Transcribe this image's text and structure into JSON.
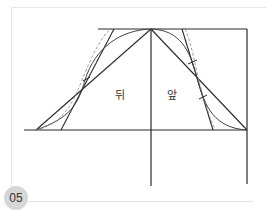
{
  "figure": {
    "step_number": "05",
    "labels": {
      "back": "뒤",
      "front": "앞"
    }
  },
  "colors": {
    "line": "#2a2a2a",
    "curve": "#444444",
    "dashed": "#888888",
    "badge_bg": "#d6d6d6",
    "frame": "#e6e6e6"
  }
}
